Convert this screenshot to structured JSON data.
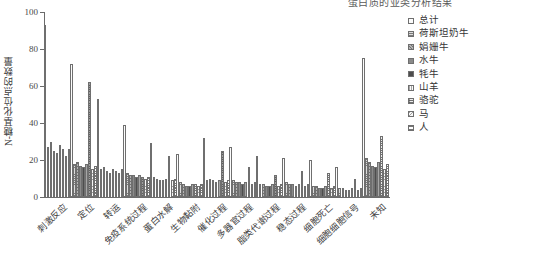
{
  "title_clipped": "蛋白质的亚类分析结果",
  "axis": {
    "ylabel": "N-糖基化位点的数量",
    "yticks": [
      0,
      20,
      40,
      60,
      80,
      100
    ],
    "ymin": 0,
    "ymax": 100,
    "grid": false
  },
  "legend": {
    "position": "right",
    "items": [
      {
        "label": "总计",
        "pattern": "open-white"
      },
      {
        "label": "荷斯坦奶牛",
        "pattern": "fine-horizontal-hatch"
      },
      {
        "label": "娟姗牛",
        "pattern": "cross-hatch-grey"
      },
      {
        "label": "水牛",
        "pattern": "solid-mid-grey"
      },
      {
        "label": "牦牛",
        "pattern": "solid-dark-grey"
      },
      {
        "label": "山羊",
        "pattern": "vertical-hatch"
      },
      {
        "label": "骆驼",
        "pattern": "grid-hatch"
      },
      {
        "label": "马",
        "pattern": "diagonal-hatch"
      },
      {
        "label": "人",
        "pattern": "dense-horizontal-hatch"
      }
    ]
  },
  "chart_data": {
    "type": "bar",
    "title": "蛋白质的亚类分析结果",
    "xlabel": "",
    "ylabel": "N-糖基化位点的数量",
    "ylim": [
      0,
      100
    ],
    "categories": [
      "刺激反应",
      "定位",
      "转运",
      "免疫系统过程",
      "蛋白水解",
      "生物黏附",
      "催化过程",
      "多器官过程",
      "脂类代谢过程",
      "稳态过程",
      "细胞死亡",
      "细胞细胞信号",
      "未知"
    ],
    "series": [
      {
        "name": "总计",
        "values": [
          93,
          72,
          53,
          39,
          29,
          23,
          32,
          27,
          22,
          21,
          20,
          16,
          75
        ]
      },
      {
        "name": "荷斯坦奶牛",
        "values": [
          27,
          18,
          15,
          13,
          11,
          8,
          9,
          9,
          7,
          8,
          6,
          5,
          21
        ]
      },
      {
        "name": "娟姗牛",
        "values": [
          30,
          19,
          16,
          12,
          10,
          7,
          10,
          8,
          7,
          7,
          6,
          5,
          19
        ]
      },
      {
        "name": "水牛",
        "values": [
          25,
          17,
          14,
          12,
          9,
          6,
          9,
          8,
          6,
          7,
          5,
          4,
          17
        ]
      },
      {
        "name": "牦牛",
        "values": [
          24,
          16,
          13,
          11,
          9,
          6,
          8,
          7,
          6,
          6,
          5,
          4,
          16
        ]
      },
      {
        "name": "山羊",
        "values": [
          28,
          18,
          15,
          12,
          10,
          7,
          9,
          8,
          7,
          7,
          6,
          5,
          19
        ]
      },
      {
        "name": "骆驼",
        "values": [
          26,
          62,
          14,
          11,
          22,
          7,
          25,
          16,
          12,
          14,
          13,
          10,
          33
        ]
      },
      {
        "name": "马",
        "values": [
          22,
          15,
          13,
          10,
          9,
          6,
          8,
          7,
          6,
          6,
          5,
          4,
          15
        ]
      },
      {
        "name": "人",
        "values": [
          26,
          17,
          15,
          11,
          10,
          7,
          9,
          8,
          7,
          7,
          6,
          5,
          18
        ]
      }
    ]
  }
}
